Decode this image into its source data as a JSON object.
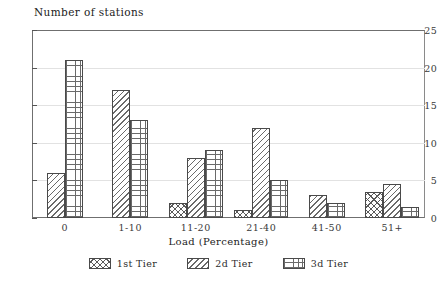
{
  "chart_data": {
    "type": "bar",
    "title": "Number of stations",
    "xlabel": "Load (Percentage)",
    "ylabel": "Number of stations",
    "categories": [
      "0",
      "1-10",
      "11-20",
      "21-40",
      "41-50",
      "51+"
    ],
    "series": [
      {
        "name": "1st Tier",
        "values": [
          0,
          0,
          2,
          1,
          0,
          3.5
        ]
      },
      {
        "name": "2d Tier",
        "values": [
          6,
          17,
          8,
          12,
          3,
          4.5
        ]
      },
      {
        "name": "3d Tier",
        "values": [
          21,
          13,
          9,
          5,
          2,
          1.5
        ]
      }
    ],
    "ylim": [
      0,
      25
    ],
    "yticks": [
      0,
      5,
      10,
      15,
      20,
      25
    ],
    "ytick_labels": [
      "0",
      "5",
      "10",
      "15",
      "20",
      "25"
    ],
    "grid": true,
    "legend_position": "bottom"
  },
  "legend": {
    "items": [
      {
        "label": "1st Tier",
        "pattern": "crosshatch-diagonal"
      },
      {
        "label": "2d Tier",
        "pattern": "diagonal-lines"
      },
      {
        "label": "3d Tier",
        "pattern": "square-grid"
      }
    ]
  },
  "colors": {
    "background": "#ffffff",
    "axis": "#6f6f6f",
    "gridline": "#e2e2e2",
    "hatch": "#5a5a5a",
    "text": "#2b2b2b"
  }
}
